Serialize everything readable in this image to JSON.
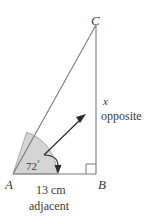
{
  "figure": {
    "type": "right-triangle-trigonometry-diagram",
    "background_color": "#ffffff",
    "stroke_color": "#6b6b6b",
    "text_color": "#3a3a3a",
    "sector_fill_color": "#d4d4d4",
    "arrow_color": "#2b2b2b"
  },
  "vertices": {
    "A": {
      "label": "A",
      "x": 13,
      "y": 174
    },
    "B": {
      "label": "B",
      "x": 96,
      "y": 174
    },
    "C": {
      "label": "C",
      "x": 96,
      "y": 25
    }
  },
  "angle": {
    "value": "72",
    "degree_symbol": "°",
    "at_vertex": "A",
    "shaded": true
  },
  "sides": {
    "opposite": {
      "variable": "x",
      "word": "opposite",
      "from": "C",
      "to": "B"
    },
    "adjacent": {
      "measure": "13 cm",
      "word": "adjacent",
      "from": "A",
      "to": "B"
    },
    "hypotenuse": {
      "from": "A",
      "to": "C"
    }
  },
  "markers": {
    "right_angle_at": "B",
    "right_angle_symbol": "square"
  },
  "annotations": {
    "opposite_arrow": {
      "name": "opposite-pointer-arrow",
      "direction": "up-right",
      "points_to": "opposite side / interior"
    },
    "adjacent_arrow": {
      "name": "adjacent-pointer-arrow",
      "direction": "curved-down",
      "points_to": "adjacent side"
    }
  }
}
